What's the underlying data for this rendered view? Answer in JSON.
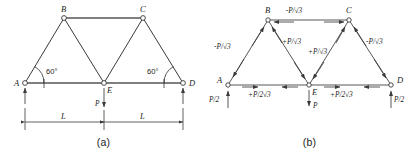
{
  "figure": {
    "title_a": "(a)",
    "title_b": "(b)"
  },
  "panel_a": {
    "caption": "(a)",
    "nodes": [
      {
        "id": "A",
        "label": "A"
      },
      {
        "id": "B",
        "label": "B"
      },
      {
        "id": "C",
        "label": "C"
      },
      {
        "id": "D",
        "label": "D"
      },
      {
        "id": "E",
        "label": "E"
      }
    ],
    "angles": [
      {
        "at": "A",
        "label": "60°"
      },
      {
        "at": "D",
        "label": "60°"
      }
    ],
    "loads": [
      {
        "at": "E",
        "label": "P",
        "direction": "down"
      }
    ],
    "reactions": [
      {
        "at": "A",
        "direction": "up"
      },
      {
        "at": "D",
        "direction": "up"
      }
    ],
    "dimensions": [
      {
        "span": "A-E",
        "label": "L"
      },
      {
        "span": "E-D",
        "label": "L"
      }
    ]
  },
  "panel_b": {
    "caption": "(b)",
    "nodes": [
      {
        "id": "A",
        "label": "A"
      },
      {
        "id": "B",
        "label": "B"
      },
      {
        "id": "C",
        "label": "C"
      },
      {
        "id": "D",
        "label": "D"
      },
      {
        "id": "E",
        "label": "E"
      }
    ],
    "member_forces": [
      {
        "member": "B-C",
        "label": "-P/√3"
      },
      {
        "member": "A-B",
        "label": "-P/√3"
      },
      {
        "member": "C-D",
        "label": "-P/√3"
      },
      {
        "member": "B-E",
        "label": "+P/√3"
      },
      {
        "member": "C-E",
        "label": "+P/√3"
      },
      {
        "member": "A-E",
        "label": "+P/2√3"
      },
      {
        "member": "E-D",
        "label": "+P/2√3"
      }
    ],
    "loads": [
      {
        "at": "E",
        "label": "P",
        "direction": "down"
      }
    ],
    "reactions": [
      {
        "at": "A",
        "label": "P/2",
        "direction": "up"
      },
      {
        "at": "D",
        "label": "P/2",
        "direction": "up"
      }
    ]
  }
}
